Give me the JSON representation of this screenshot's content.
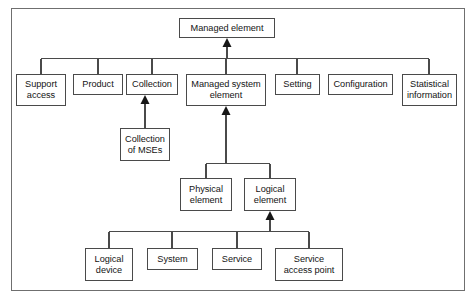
{
  "diagram": {
    "type": "uml-generalization-hierarchy",
    "colors": {
      "frame_border": "#6f6f6f",
      "node_border": "#4a4a4a",
      "node_fill": "#ffffff",
      "edge": "#4a4a4a",
      "text": "#141414",
      "background": "#ffffff"
    },
    "nodes": [
      {
        "id": "managed-element",
        "label": "Managed element",
        "x": 179,
        "y": 18,
        "w": 96,
        "h": 20
      },
      {
        "id": "support-access",
        "label": "Support\naccess",
        "x": 16,
        "y": 74,
        "w": 50,
        "h": 32
      },
      {
        "id": "product",
        "label": "Product",
        "x": 73,
        "y": 74,
        "w": 50,
        "h": 21
      },
      {
        "id": "collection",
        "label": "Collection",
        "x": 126,
        "y": 74,
        "w": 52,
        "h": 21
      },
      {
        "id": "managed-system-element",
        "label": "Managed system\nelement",
        "x": 186,
        "y": 74,
        "w": 80,
        "h": 32
      },
      {
        "id": "setting",
        "label": "Setting",
        "x": 275,
        "y": 74,
        "w": 45,
        "h": 21
      },
      {
        "id": "configuration",
        "label": "Configuration",
        "x": 328,
        "y": 74,
        "w": 65,
        "h": 21
      },
      {
        "id": "statistical-information",
        "label": "Statistical\ninformation",
        "x": 402,
        "y": 74,
        "w": 55,
        "h": 32
      },
      {
        "id": "collection-of-mses",
        "label": "Collection\nof MSEs",
        "x": 120,
        "y": 128,
        "w": 50,
        "h": 33
      },
      {
        "id": "physical-element",
        "label": "Physical\nelement",
        "x": 180,
        "y": 178,
        "w": 52,
        "h": 33
      },
      {
        "id": "logical-element",
        "label": "Logical\nelement",
        "x": 244,
        "y": 178,
        "w": 52,
        "h": 33
      },
      {
        "id": "logical-device",
        "label": "Logical\ndevice",
        "x": 85,
        "y": 248,
        "w": 48,
        "h": 33
      },
      {
        "id": "system",
        "label": "System",
        "x": 147,
        "y": 248,
        "w": 51,
        "h": 22
      },
      {
        "id": "service",
        "label": "Service",
        "x": 212,
        "y": 248,
        "w": 50,
        "h": 22
      },
      {
        "id": "service-access-point",
        "label": "Service\naccess point",
        "x": 275,
        "y": 248,
        "w": 68,
        "h": 33
      }
    ],
    "edges": [
      {
        "from": "support-access",
        "to": "managed-element",
        "via_bus": "top-bus"
      },
      {
        "from": "product",
        "to": "managed-element",
        "via_bus": "top-bus"
      },
      {
        "from": "collection",
        "to": "managed-element",
        "via_bus": "top-bus"
      },
      {
        "from": "managed-system-element",
        "to": "managed-element",
        "via_bus": "top-bus"
      },
      {
        "from": "setting",
        "to": "managed-element",
        "via_bus": "top-bus"
      },
      {
        "from": "statistical-information",
        "to": "managed-element",
        "via_bus": "top-bus"
      },
      {
        "from": "collection-of-mses",
        "to": "collection",
        "via_bus": "none"
      },
      {
        "from": "physical-element",
        "to": "managed-system-element",
        "via_bus": "mid-bus"
      },
      {
        "from": "logical-element",
        "to": "managed-system-element",
        "via_bus": "mid-bus"
      },
      {
        "from": "logical-device",
        "to": "logical-element",
        "via_bus": "bottom-bus"
      },
      {
        "from": "system",
        "to": "logical-element",
        "via_bus": "bottom-bus"
      },
      {
        "from": "service",
        "to": "logical-element",
        "via_bus": "bottom-bus"
      },
      {
        "from": "service-access-point",
        "to": "logical-element",
        "via_bus": "bottom-bus"
      }
    ],
    "arrowheads": [
      {
        "at": "managed-element",
        "style": "filled-triangle"
      },
      {
        "at": "collection",
        "style": "filled-triangle"
      },
      {
        "at": "managed-system-element",
        "style": "filled-triangle"
      },
      {
        "at": "logical-element",
        "style": "filled-triangle"
      }
    ]
  }
}
